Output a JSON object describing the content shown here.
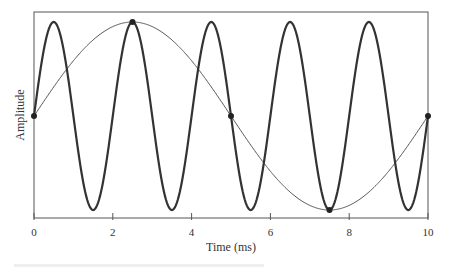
{
  "chart_data": {
    "type": "line",
    "title": "",
    "xlabel": "Time (ms)",
    "ylabel": "Amplitude",
    "xlim": [
      0,
      10
    ],
    "ylim": [
      -1,
      1
    ],
    "x_ticks": [
      0,
      2,
      4,
      6,
      8,
      10
    ],
    "x_tick_labels": [
      "0",
      "2",
      "4",
      "6",
      "8",
      "10"
    ],
    "y_ticks": [],
    "grid": false,
    "legend": null,
    "series": [
      {
        "name": "fast sine (period 2 ms)",
        "style": "thick",
        "color": "#333333",
        "function": "sin(2*pi*t/2)",
        "amplitude": 1,
        "period_ms": 2,
        "x": [
          0,
          0.5,
          1,
          1.5,
          2,
          2.5,
          3,
          3.5,
          4,
          4.5,
          5,
          5.5,
          6,
          6.5,
          7,
          7.5,
          8,
          8.5,
          9,
          9.5,
          10
        ],
        "values": [
          0,
          1,
          0,
          -1,
          0,
          1,
          0,
          -1,
          0,
          1,
          0,
          -1,
          0,
          1,
          0,
          -1,
          0,
          1,
          0,
          -1,
          0
        ]
      },
      {
        "name": "slow sine (period 10 ms)",
        "style": "thin",
        "color": "#555555",
        "function": "sin(2*pi*t/10)",
        "amplitude": 1,
        "period_ms": 10,
        "x": [
          0,
          2.5,
          5,
          7.5,
          10
        ],
        "values": [
          0,
          1,
          0,
          -1,
          0
        ]
      }
    ],
    "markers": [
      {
        "x": 0,
        "y": 0
      },
      {
        "x": 2.5,
        "y": 1
      },
      {
        "x": 5,
        "y": 0
      },
      {
        "x": 7.5,
        "y": -1
      },
      {
        "x": 10,
        "y": 0
      }
    ]
  },
  "layout": {
    "plot_left": 34,
    "plot_right": 428,
    "plot_top": 12,
    "plot_bottom": 218,
    "y_zero_px": 116,
    "amp_px": 94
  }
}
